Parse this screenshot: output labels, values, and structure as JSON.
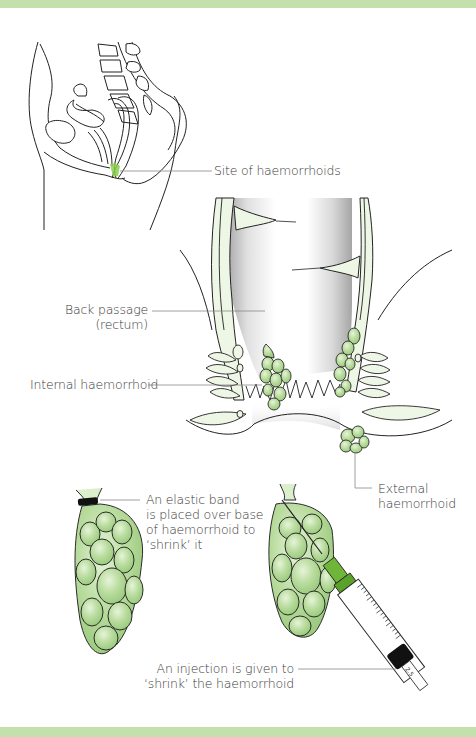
{
  "theme": {
    "band_color": "#c3e0ad",
    "tissue_fill": "#eef6e6",
    "haemorrhoid_fill": "#b9dc9e",
    "haemorrhoid_light": "#dcefcc",
    "highlight_green": "#8ccf4e",
    "needle_hub": "#6fb53a",
    "line_color": "#1e1e1e",
    "leader_color": "#7a7a7a"
  },
  "figure": {
    "panels": [
      {
        "id": "sagittal-view",
        "description": "Side cross-section of pelvis showing location of haemorrhoids"
      },
      {
        "id": "anal-canal-section",
        "description": "Cross-section of rectum and anal canal with internal and external haemorrhoids"
      },
      {
        "id": "banding",
        "description": "Haemorrhoid with elastic band placed around base"
      },
      {
        "id": "injection",
        "description": "Syringe injecting into haemorrhoid"
      }
    ],
    "labels": {
      "site": "Site of haemorrhoids",
      "rectum_line1": "Back passage",
      "rectum_line2": "(rectum)",
      "internal": "Internal haemorrhoid",
      "external_line1": "External",
      "external_line2": "haemorrhoid",
      "band_line1": "An elastic band",
      "band_line2": "is placed over base",
      "band_line3": "of haemorrhoid to",
      "band_line4": "‘shrink’ it",
      "injection_line1": "An injection is given to",
      "injection_line2": "‘shrink’ the haemorrhoid"
    },
    "syringe": {
      "scale_mark": "2.5"
    }
  }
}
